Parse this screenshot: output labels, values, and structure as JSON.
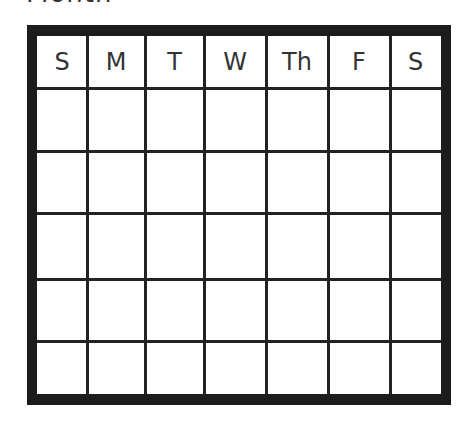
{
  "title": "Month",
  "calendar": {
    "days": [
      "S",
      "M",
      "T",
      "W",
      "Th",
      "F",
      "S"
    ],
    "rows": 5,
    "colors": {
      "border": "#1c1c1c",
      "lines": "#222222",
      "background": "#ffffff",
      "text": "#333333"
    }
  }
}
